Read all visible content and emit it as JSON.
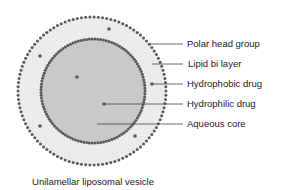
{
  "diagram": {
    "title": "Unilamellar liposomal vesicle",
    "colors": {
      "core": "#c9c9c9",
      "bilayer": "#ededed",
      "dots": "#5a5a5a",
      "lines": "#444444"
    },
    "labels": [
      {
        "text": "Polar head group",
        "y": 44
      },
      {
        "text": "Lipid bi layer",
        "y": 64
      },
      {
        "text": "Hydrophobic drug",
        "y": 84
      },
      {
        "text": "Hydrophilic drug",
        "y": 104
      },
      {
        "text": "Aqueous core",
        "y": 124
      }
    ]
  }
}
